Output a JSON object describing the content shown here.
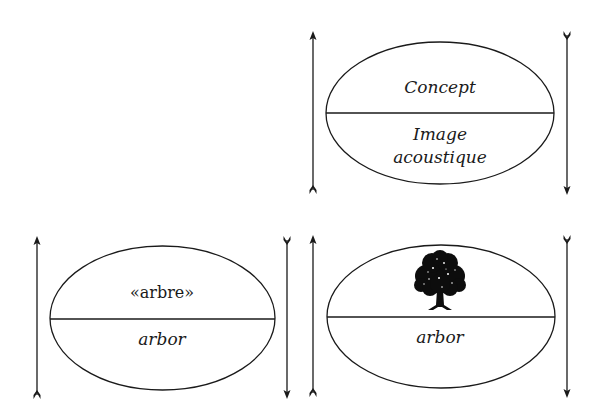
{
  "diagrams": [
    {
      "id": "general-sign",
      "upper_label": "Concept",
      "lower_label_line1": "Image",
      "lower_label_line2": "acoustique"
    },
    {
      "id": "arbor-word",
      "upper_label": "«arbre»",
      "lower_label": "arbor"
    },
    {
      "id": "arbor-image",
      "upper_icon": "tree-icon",
      "lower_label": "arbor"
    }
  ],
  "colors": {
    "stroke": "#1a1a1a",
    "background": "#ffffff"
  }
}
